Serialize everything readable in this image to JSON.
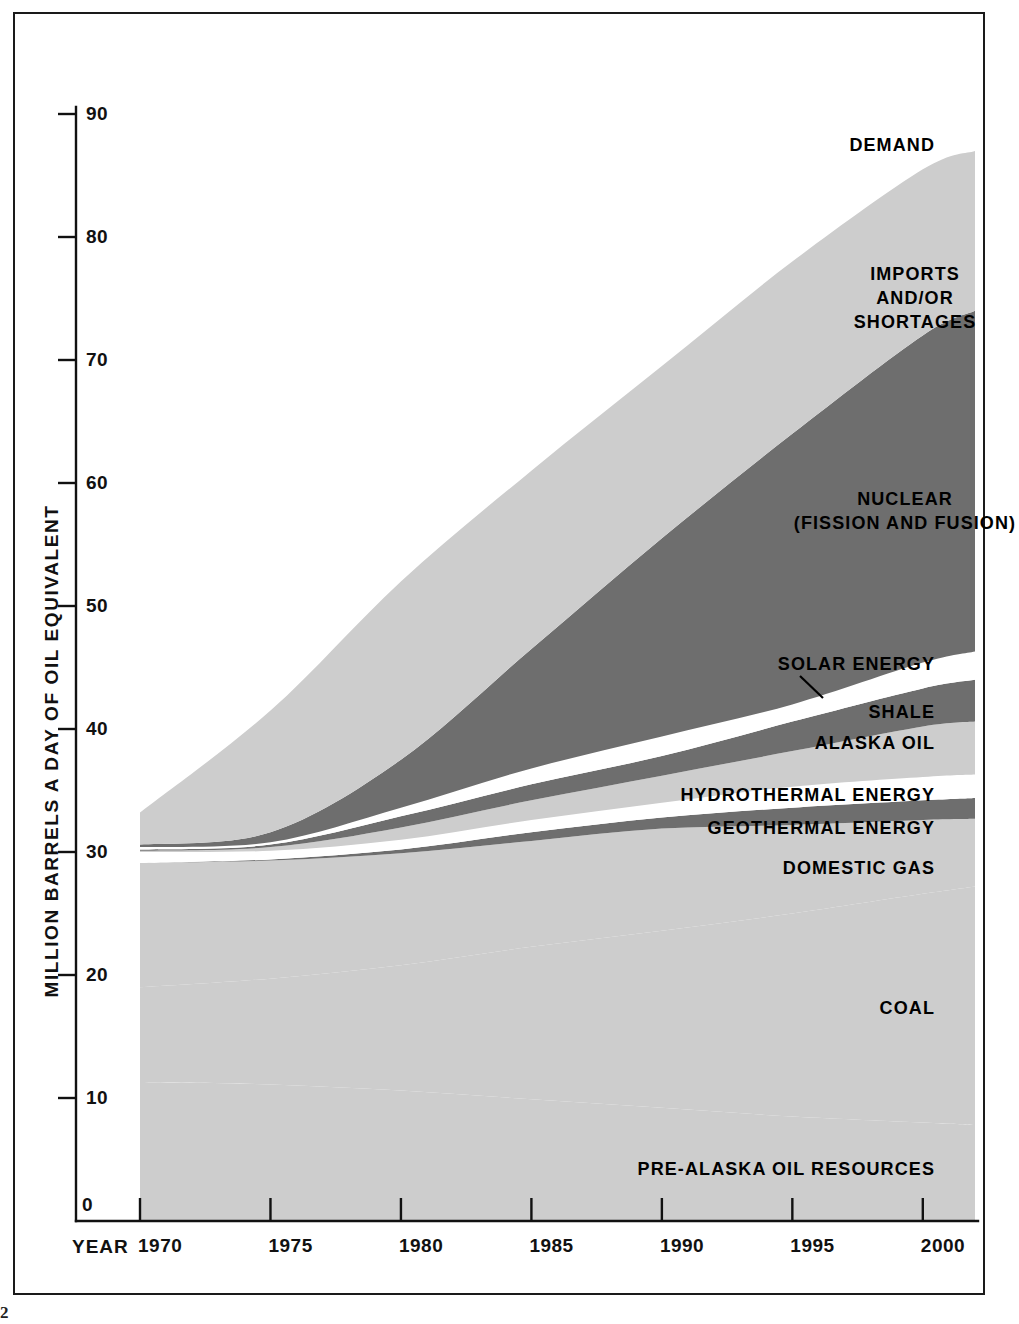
{
  "page": {
    "page_number": "2"
  },
  "axes": {
    "y_label": "MILLION BARRELS A DAY OF OIL EQUIVALENT",
    "y_ticks": [
      "90",
      "80",
      "70",
      "60",
      "50",
      "40",
      "30",
      "20",
      "10",
      "0"
    ],
    "x_word": "YEAR",
    "x_ticks": [
      "1970",
      "1975",
      "1980",
      "1985",
      "1990",
      "1995",
      "2000"
    ]
  },
  "labels": {
    "demand": "DEMAND",
    "imports": "IMPORTS\nAND/OR\nSHORTAGES",
    "nuclear": "NUCLEAR\n(FISSION AND FUSION)",
    "solar": "SOLAR ENERGY",
    "shale": "SHALE",
    "alaska": "ALASKA OIL",
    "hydrothermal": "HYDROTHERMAL ENERGY",
    "geothermal": "GEOTHERMAL ENERGY",
    "domestic_gas": "DOMESTIC GAS",
    "coal": "COAL",
    "pre_alaska": "PRE-ALASKA OIL RESOURCES"
  },
  "colors": {
    "light_gray": "#cdcdcd",
    "dark_gray": "#6e6e6e",
    "white": "#ffffff",
    "ink": "#111111"
  },
  "chart_data": {
    "type": "area",
    "title": "",
    "xlabel": "YEAR",
    "ylabel": "MILLION BARRELS A DAY OF OIL EQUIVALENT",
    "xlim": [
      1970,
      2002
    ],
    "ylim": [
      0,
      90
    ],
    "grid": false,
    "legend": "inline-labels",
    "x": [
      1970,
      1975,
      1980,
      1985,
      1990,
      1995,
      2000,
      2002
    ],
    "boundaries": {
      "demand_top": [
        33.2,
        41.5,
        52.0,
        61.0,
        69.5,
        78.0,
        85.5,
        87.0
      ],
      "nuclear_top": [
        30.6,
        31.6,
        37.5,
        46.5,
        55.5,
        64.0,
        72.0,
        74.0
      ],
      "nuclear_bottom": [
        30.4,
        30.8,
        33.6,
        36.8,
        39.4,
        42.0,
        45.4,
        46.3
      ],
      "solar_band_top": [
        30.4,
        30.8,
        33.6,
        36.8,
        39.4,
        42.0,
        45.4,
        46.3
      ],
      "shale_top": [
        30.2,
        30.6,
        32.9,
        35.5,
        37.8,
        40.6,
        43.3,
        44.0
      ],
      "shale_bottom": [
        30.1,
        30.4,
        32.0,
        34.2,
        36.2,
        38.2,
        40.2,
        40.6
      ],
      "alaska_bottom": [
        30.0,
        30.1,
        31.0,
        32.6,
        34.0,
        35.3,
        36.1,
        36.3
      ],
      "hydro_bottom": [
        29.1,
        29.4,
        30.2,
        31.6,
        32.8,
        33.6,
        34.2,
        34.4
      ],
      "geothermal_bottom": [
        29.1,
        29.3,
        29.9,
        30.9,
        31.9,
        32.2,
        32.6,
        32.7
      ],
      "gas_bottom": [
        19.0,
        19.7,
        20.8,
        22.3,
        23.6,
        25.0,
        26.6,
        27.2
      ],
      "coal_top": [
        19.0,
        19.7,
        20.8,
        22.3,
        23.6,
        25.0,
        26.6,
        27.2
      ],
      "coal_bottom": [
        11.3,
        11.1,
        10.6,
        9.9,
        9.2,
        8.5,
        8.0,
        7.8
      ],
      "prealaska_top": [
        11.3,
        11.1,
        10.6,
        9.9,
        9.2,
        8.5,
        8.0,
        7.8
      ],
      "prealaska_bottom": [
        0,
        0,
        0,
        0,
        0,
        0,
        0,
        0
      ]
    },
    "series": [
      {
        "name": "PRE-ALASKA OIL RESOURCES",
        "color": "#cdcdcd"
      },
      {
        "name": "COAL",
        "color": "#cdcdcd"
      },
      {
        "name": "DOMESTIC GAS",
        "color": "#cdcdcd"
      },
      {
        "name": "GEOTHERMAL ENERGY",
        "color": "#6e6e6e"
      },
      {
        "name": "HYDROTHERMAL ENERGY",
        "color": "#ffffff"
      },
      {
        "name": "ALASKA OIL",
        "color": "#cdcdcd"
      },
      {
        "name": "SHALE",
        "color": "#6e6e6e"
      },
      {
        "name": "SOLAR ENERGY",
        "color": "#ffffff"
      },
      {
        "name": "NUCLEAR (FISSION AND FUSION)",
        "color": "#6e6e6e"
      },
      {
        "name": "IMPORTS AND/OR SHORTAGES",
        "color": "#cdcdcd"
      }
    ]
  }
}
